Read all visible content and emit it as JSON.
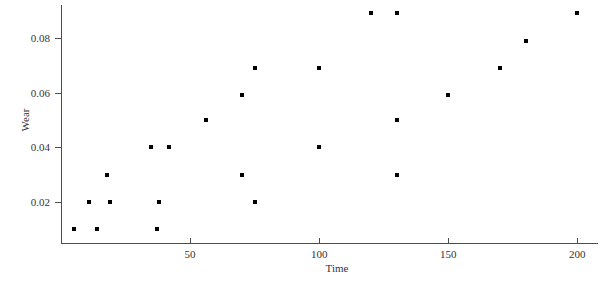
{
  "chart_data": {
    "type": "scatter",
    "title": "",
    "xlabel": "Time",
    "ylabel": "Wear",
    "xlim": [
      0,
      208
    ],
    "ylim": [
      0.005,
      0.092
    ],
    "grid": false,
    "legend": null,
    "xticks": [
      50,
      100,
      150,
      200
    ],
    "xticklabels": [
      "50",
      "100",
      "150",
      "200"
    ],
    "yticks": [
      0.02,
      0.04,
      0.06,
      0.08
    ],
    "yticklabels": [
      "0.02",
      "0.04",
      "0.06",
      "0.08"
    ],
    "marker": "square",
    "marker_color": "#000000",
    "series": [
      {
        "name": "Wear vs Time",
        "points": [
          {
            "x": 5,
            "y": 0.01
          },
          {
            "x": 11,
            "y": 0.02
          },
          {
            "x": 14,
            "y": 0.01
          },
          {
            "x": 18,
            "y": 0.03
          },
          {
            "x": 19,
            "y": 0.02
          },
          {
            "x": 35,
            "y": 0.04
          },
          {
            "x": 37,
            "y": 0.01
          },
          {
            "x": 38,
            "y": 0.02
          },
          {
            "x": 42,
            "y": 0.04
          },
          {
            "x": 56,
            "y": 0.05
          },
          {
            "x": 70,
            "y": 0.03
          },
          {
            "x": 70,
            "y": 0.059
          },
          {
            "x": 75,
            "y": 0.02
          },
          {
            "x": 75,
            "y": 0.069
          },
          {
            "x": 100,
            "y": 0.04
          },
          {
            "x": 100,
            "y": 0.069
          },
          {
            "x": 120,
            "y": 0.089
          },
          {
            "x": 130,
            "y": 0.03
          },
          {
            "x": 130,
            "y": 0.05
          },
          {
            "x": 130,
            "y": 0.089
          },
          {
            "x": 150,
            "y": 0.059
          },
          {
            "x": 170,
            "y": 0.069
          },
          {
            "x": 180,
            "y": 0.079
          },
          {
            "x": 200,
            "y": 0.089
          }
        ]
      }
    ]
  },
  "axes": {
    "x_label": "Time",
    "y_label": "Wear"
  },
  "colors": {
    "axis": "#4d4d4d",
    "marker": "#000000",
    "text": "#333333",
    "background": "#ffffff"
  }
}
